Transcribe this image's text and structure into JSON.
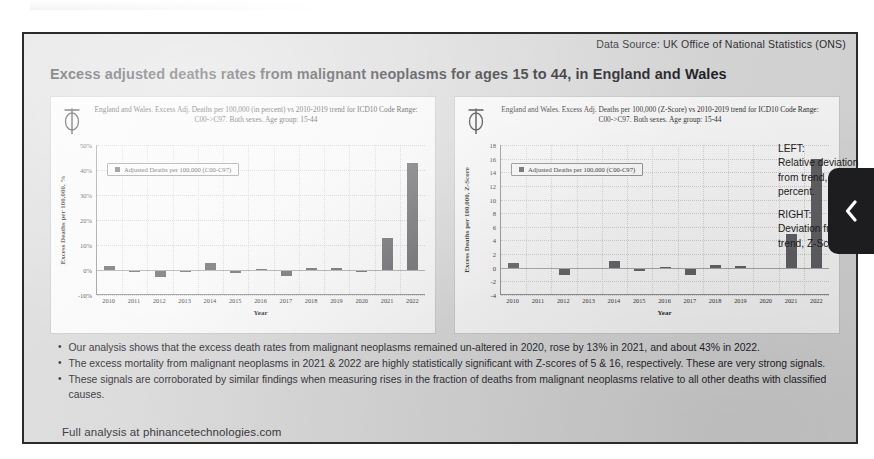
{
  "header": {
    "data_source": "Data Source: UK Office of National Statistics (ONS)"
  },
  "slide": {
    "title": "Excess adjusted deaths rates from malignant neoplasms for ages 15 to 44, in England and Wales",
    "footer_note": "Full analysis at phinancetechnologies.com"
  },
  "bullets": [
    {
      "marker": "•",
      "text": "Our analysis shows that the excess death rates from malignant neoplasms remained un-altered in 2020, rose by 13% in 2021, and about 43% in 2022."
    },
    {
      "marker": "•",
      "text": "The excess mortality from malignant neoplasms in 2021 & 2022 are highly statistically significant with Z-scores of 5 & 16, respectively. These are very strong signals."
    },
    {
      "marker": "•",
      "text": "These signals are corroborated by similar findings when measuring rises in the fraction of deaths from malignant neoplasms relative to all other deaths with classified causes."
    }
  ],
  "side_caption": {
    "left_head": "LEFT:",
    "left_body": "Relative deviation from trend, in percent.",
    "right_head": "RIGHT:",
    "right_body": "Deviation from trend, Z-Score.",
    "prev_icon": "chevron-left-icon"
  },
  "chart_data": [
    {
      "id": "left",
      "type": "bar",
      "title": "England and Wales. Excess Adj. Deaths per 100,000 (in percent) vs 2010-2019 trend for ICD10 Code Range: C00->C97. Both sexes. Age group: 15-44",
      "xlabel": "Year",
      "ylabel": "Excess Deaths per 100,000, %",
      "legend": "Adjusted Deaths per 100,000 (C00-C97)",
      "legend_position": "top-left",
      "grid": true,
      "ylim": [
        -10,
        50
      ],
      "ytick_values": [
        -10,
        0,
        10,
        20,
        30,
        40,
        50
      ],
      "ytick_labels": [
        "-10%",
        "0%",
        "10%",
        "20%",
        "30%",
        "40%",
        "50%"
      ],
      "categories": [
        "2010",
        "2011",
        "2012",
        "2013",
        "2014",
        "2015",
        "2016",
        "2017",
        "2018",
        "2019",
        "2020",
        "2021",
        "2022"
      ],
      "values": [
        1.6,
        -0.5,
        -2.6,
        -0.3,
        2.8,
        -1.0,
        0.3,
        -2.3,
        1.0,
        0.8,
        -0.6,
        13.0,
        43.0
      ],
      "bar_color": "#5f5f63"
    },
    {
      "id": "right",
      "type": "bar",
      "title": "England and Wales. Excess Adj. Deaths per 100,000 (Z-Score) vs 2010-2019 trend for ICD10 Code Range: C00->C97. Both sexes. Age group: 15-44",
      "xlabel": "Year",
      "ylabel": "Excess Deaths per 100,000, Z-Score",
      "legend": "Adjusted Deaths per 100,000 (C00-C97)",
      "legend_position": "top-left",
      "grid": true,
      "ylim": [
        -4,
        18
      ],
      "ytick_values": [
        -4,
        -2,
        0,
        2,
        4,
        6,
        8,
        10,
        12,
        14,
        16,
        18
      ],
      "ytick_labels": [
        "-4",
        "-2",
        "0",
        "2",
        "4",
        "6",
        "8",
        "10",
        "12",
        "14",
        "16",
        "18"
      ],
      "categories": [
        "2010",
        "2011",
        "2012",
        "2013",
        "2014",
        "2015",
        "2016",
        "2017",
        "2018",
        "2019",
        "2020",
        "2021",
        "2022"
      ],
      "values": [
        0.7,
        -0.15,
        -1.1,
        0.0,
        1.0,
        -0.45,
        0.1,
        -1.0,
        0.35,
        0.3,
        -0.25,
        5.0,
        16.0
      ],
      "bar_color": "#5f5f63"
    }
  ]
}
